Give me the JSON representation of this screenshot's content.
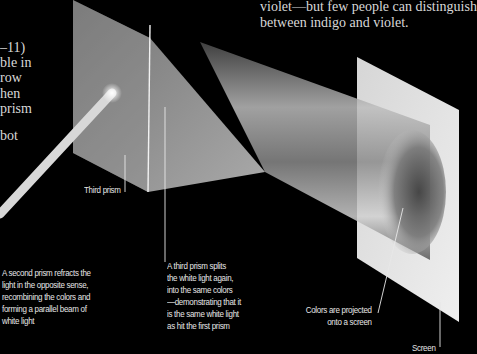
{
  "body_text_right": {
    "lines": [
      "violet—but few people can distinguish",
      "between indigo and violet."
    ]
  },
  "body_text_left_fragment": {
    "lines": [
      "–11)",
      "ble in",
      "row",
      "hen",
      "prism",
      "",
      "bot"
    ]
  },
  "labels": {
    "third_prism": "Third prism",
    "second_prism": {
      "lines": [
        "A second prism refracts the",
        "light in the opposite sense,",
        "recombining the colors and",
        "forming a parallel beam of",
        "white light"
      ]
    },
    "third_prism_note": {
      "lines": [
        "A third prism splits",
        "the white light again,",
        "into the same colors",
        "—demonstrating that it",
        "is the same white light",
        "as hit the first prism"
      ]
    },
    "colors_projected": {
      "lines": [
        "Colors are projected",
        "onto a screen"
      ]
    },
    "screen": "Screen"
  },
  "colors": {
    "background": "#000000",
    "text": "#d8d8d8",
    "leader_line": "#e8e8e8",
    "screen": "#e2e2e2",
    "beam": "#cfcfcf"
  }
}
